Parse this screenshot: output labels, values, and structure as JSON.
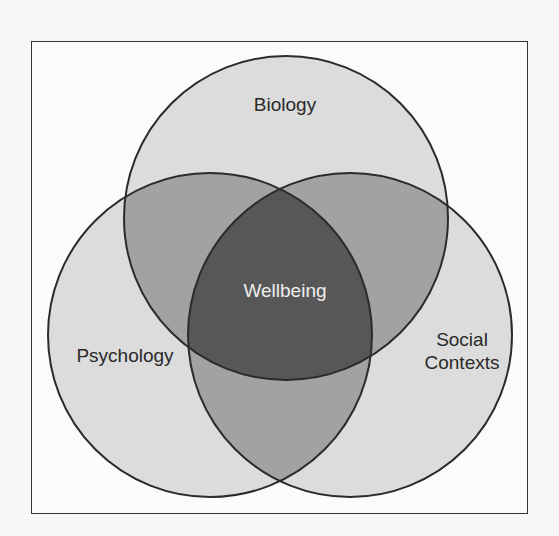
{
  "diagram": {
    "type": "venn-3",
    "sets": [
      {
        "id": "biology",
        "label": "Biology"
      },
      {
        "id": "psychology",
        "label": "Psychology"
      },
      {
        "id": "social",
        "label": "Social\nContexts"
      }
    ],
    "center_label": "Wellbeing",
    "colors": {
      "single": "#dcdcdc",
      "pairwise": "#a2a2a2",
      "center": "#575757",
      "outline": "#2b2b2b",
      "frame": "#333333"
    }
  }
}
